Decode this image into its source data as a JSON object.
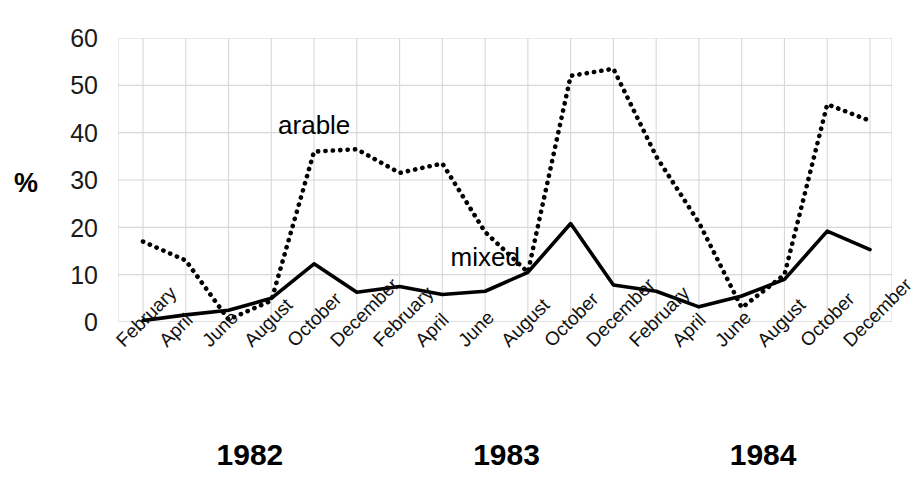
{
  "chart_data": {
    "type": "line",
    "title": "",
    "xlabel": "",
    "ylabel": "%",
    "ylim": [
      0,
      60
    ],
    "yticks": [
      0,
      10,
      20,
      30,
      40,
      50,
      60
    ],
    "grid": true,
    "legend_position": "inline-annotations",
    "x": [
      "February 1982",
      "April 1982",
      "June 1982",
      "August 1982",
      "October 1982",
      "December 1982",
      "February 1983",
      "April 1983",
      "June 1983",
      "August 1983",
      "October 1983",
      "December 1983",
      "February 1984",
      "April 1984",
      "June 1984",
      "August 1984",
      "October 1984",
      "December 1984"
    ],
    "categories": [
      "February",
      "April",
      "June",
      "August",
      "October",
      "December",
      "February",
      "April",
      "June",
      "August",
      "October",
      "December",
      "February",
      "April",
      "June",
      "August",
      "October",
      "December"
    ],
    "year_groups": [
      {
        "label": "1982",
        "start_index": 0,
        "end_index": 5
      },
      {
        "label": "1983",
        "start_index": 6,
        "end_index": 11
      },
      {
        "label": "1984",
        "start_index": 12,
        "end_index": 17
      }
    ],
    "series": [
      {
        "name": "arable",
        "style": "dotted",
        "color": "#000000",
        "values": [
          17,
          13,
          0.5,
          4.5,
          36,
          36.5,
          31.5,
          33.5,
          19,
          10.5,
          52,
          53.5,
          35,
          21,
          3,
          10,
          46,
          42.5
        ]
      },
      {
        "name": "mixed",
        "style": "solid",
        "color": "#000000",
        "values": [
          0.3,
          1.5,
          2.5,
          5,
          12.3,
          6.3,
          7.5,
          5.8,
          6.5,
          10.5,
          20.8,
          7.8,
          6.5,
          3.2,
          5.5,
          9,
          19.2,
          15.3
        ]
      }
    ],
    "annotations": [
      {
        "text": "arable",
        "x_index": 4,
        "y_value": 41
      },
      {
        "text": "mixed",
        "x_index": 8,
        "y_value": 13
      }
    ]
  },
  "axes": {
    "y_title": "%",
    "y_tick_labels": [
      "60",
      "50",
      "40",
      "30",
      "20",
      "10",
      "0"
    ],
    "x_tick_labels": [
      "February",
      "April",
      "June",
      "August",
      "October",
      "December",
      "February",
      "April",
      "June",
      "August",
      "October",
      "December",
      "February",
      "April",
      "June",
      "August",
      "October",
      "December"
    ]
  },
  "year_labels": [
    "1982",
    "1983",
    "1984"
  ],
  "series_labels": {
    "arable": "arable",
    "mixed": "mixed"
  },
  "caption_fragment": "",
  "colors": {
    "line": "#000000",
    "grid": "#d8d8d8",
    "text": "#111111",
    "background": "#ffffff"
  }
}
